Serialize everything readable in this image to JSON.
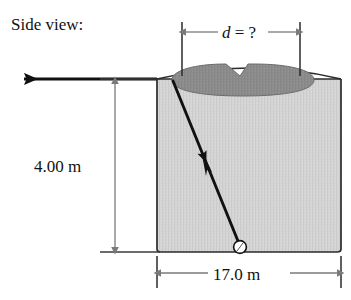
{
  "figure": {
    "title_label": "Side view:",
    "caption_kind": "optics-refraction-diagram",
    "colors": {
      "background": "#ffffff",
      "cylinder_fill": "#d2d2d2",
      "cylinder_outline": "#2b2b2b",
      "light_pool_fill": "#8c8c8c",
      "light_pool_outline": "#6a6a6a",
      "ray_stroke": "#111111",
      "dimension_stroke": "#7a7a7a",
      "baseline_stroke": "#3a3a3a",
      "source_fill": "#ffffff",
      "text": "#111111"
    },
    "dimensions": {
      "top": {
        "name": "diameter-unknown",
        "symbol": "d",
        "relation": " = ?",
        "full_label": "d = ?",
        "arrow_style": "double-headed"
      },
      "left": {
        "name": "depth",
        "value": "4.00",
        "unit": "m",
        "full_label": "4.00 m",
        "arrow_style": "double-headed"
      },
      "bottom": {
        "name": "width",
        "value": "17.0",
        "unit": "m",
        "full_label": "17.0 m",
        "arrow_style": "double-headed"
      }
    },
    "elements": {
      "cylinder": "water-tank-cylinder",
      "light_pool": "illuminated-ellipse-on-surface",
      "incident_ray": "ray-from-source-to-surface",
      "refracted_ray": "horizontal-refracted-ray-leftward",
      "source": "point-light-source"
    }
  }
}
